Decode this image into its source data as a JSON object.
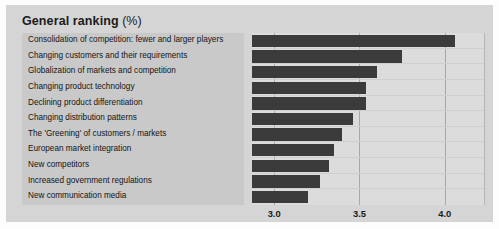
{
  "panel": {
    "title_main": "General ranking",
    "title_suffix": "(%)",
    "bar_color": "#3b3b3b",
    "panel_bg": "#d5d5d5",
    "label_bg": "#c9c9c9",
    "plot_bg": "#dcdcdc"
  },
  "chart_data": {
    "type": "bar",
    "orientation": "horizontal",
    "title": "General ranking (%)",
    "xlabel": "",
    "ylabel": "",
    "xlim": [
      2.87,
      4.23
    ],
    "xticks": [
      3.0,
      3.5,
      4.0
    ],
    "xtick_labels": [
      "3.0",
      "3.5",
      "4.0"
    ],
    "grid": true,
    "legend": "none",
    "categories": [
      "Consolidation of competition: fewer and larger players",
      "Changing customers and their requirements",
      "Globalization of markets and competition",
      "Changing product technology",
      "Declining product differentiation",
      "Changing distribution patterns",
      "The 'Greening' of customers / markets",
      "European market integration",
      "New competitors",
      "Increased government regulations",
      "New communication media"
    ],
    "values": [
      4.06,
      3.75,
      3.6,
      3.54,
      3.54,
      3.46,
      3.4,
      3.35,
      3.32,
      3.27,
      3.2
    ]
  }
}
